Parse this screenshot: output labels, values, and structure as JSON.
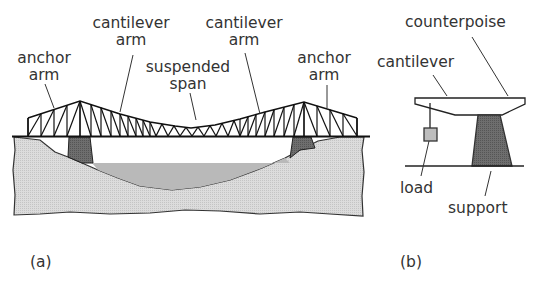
{
  "panel_a": {
    "caption": "(a)",
    "labels": {
      "anchor_arm_left_1": "anchor",
      "anchor_arm_left_2": "arm",
      "cantilever_arm_left_1": "cantilever",
      "cantilever_arm_left_2": "arm",
      "suspended_span_1": "suspended",
      "suspended_span_2": "span",
      "cantilever_arm_right_1": "cantilever",
      "cantilever_arm_right_2": "arm",
      "anchor_arm_right_1": "anchor",
      "anchor_arm_right_2": "arm"
    }
  },
  "panel_b": {
    "caption": "(b)",
    "labels": {
      "counterpoise": "counterpoise",
      "cantilever": "cantilever",
      "load": "load",
      "support": "support"
    }
  },
  "colors": {
    "line": "#1a1a1a",
    "ground": "#d8d8d8",
    "water": "#b8b8b8",
    "pier": "#6a6a6a",
    "load_box": "#bdbdbd"
  }
}
